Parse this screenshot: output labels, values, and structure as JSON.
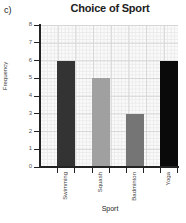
{
  "part_label": "c)",
  "chart_data": {
    "type": "bar",
    "title": "Choice of Sport",
    "xlabel": "Sport",
    "ylabel": "Frequency",
    "categories": [
      "Swimming",
      "Squash",
      "Badminton",
      "Yoga"
    ],
    "values": [
      6,
      5,
      3,
      6
    ],
    "colors": [
      "#333333",
      "#a0a0a0",
      "#757575",
      "#0a0a0a"
    ],
    "ylim": [
      0,
      8
    ],
    "yticks": [
      0,
      1,
      2,
      3,
      4,
      5,
      6,
      7,
      8
    ],
    "grid": true,
    "legend": null
  }
}
